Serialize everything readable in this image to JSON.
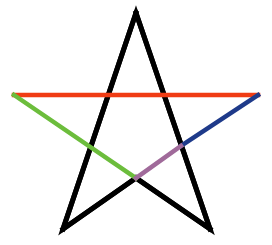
{
  "diagram": {
    "type": "pentagram",
    "segments": [
      {
        "name": "left-arm-outer",
        "from": "top",
        "to": "bottom-left",
        "color": "#000000"
      },
      {
        "name": "right-arm-outer",
        "from": "top",
        "to": "bottom-right",
        "color": "#000000"
      },
      {
        "name": "bottom-left-to-center",
        "from": "bottom-left",
        "to": "center-bottom",
        "color": "#000000"
      },
      {
        "name": "bottom-right-to-center",
        "from": "bottom-right",
        "to": "center-bottom",
        "color": "#000000"
      },
      {
        "name": "horizontal-chord",
        "from": "left",
        "to": "right",
        "color": "#f03c14"
      },
      {
        "name": "left-diagonal-chord",
        "from": "left",
        "to": "center-bottom",
        "color": "#6cbd3c"
      },
      {
        "name": "right-diagonal-upper",
        "from": "right",
        "to": "right-inner",
        "color": "#1e3a8a"
      },
      {
        "name": "right-diagonal-lower",
        "from": "right-inner",
        "to": "center-bottom",
        "color": "#a06a9a"
      }
    ],
    "colors": {
      "background": "#ffffff",
      "outline": "#000000",
      "red": "#f03c14",
      "green": "#6cbd3c",
      "blue": "#1e3a8a",
      "purple": "#a06a9a"
    }
  }
}
